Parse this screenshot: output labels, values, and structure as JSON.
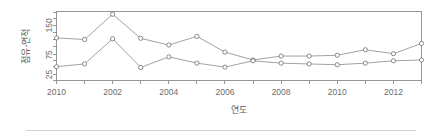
{
  "figure": {
    "width": 442,
    "height": 136,
    "background": "#ffffff",
    "line_color": "#8a8a8a",
    "marker_stroke": "#6e6e6e",
    "axis_color": "#7d7d7d",
    "text_color": "#6b6b6b"
  },
  "footer": {
    "rule_color": "#d2d2d2"
  },
  "chart_data": {
    "type": "line",
    "title": "",
    "xlabel": "연도",
    "ylabel": "점유-면적",
    "grid": false,
    "legend": false,
    "marker": "open-circle",
    "xlim": [
      0,
      13
    ],
    "ylim": [
      10,
      185
    ],
    "x": [
      0,
      1,
      2,
      3,
      4,
      5,
      6,
      7,
      8,
      9,
      10,
      11,
      12,
      13
    ],
    "x_tick_positions": [
      0,
      1,
      2,
      3,
      4,
      5,
      6,
      7,
      8,
      9,
      10,
      11,
      12,
      13
    ],
    "x_tick_labels": [
      "2010",
      "",
      "2002",
      "",
      "2004",
      "",
      "2006",
      "",
      "2008",
      "",
      "2010",
      "",
      "2012",
      ""
    ],
    "y_tick_values": [
      25,
      75,
      150
    ],
    "y_tick_labels": [
      "25",
      "75",
      "150"
    ],
    "y_minor_ticks": [
      10,
      25,
      45,
      60,
      75,
      95,
      115,
      132,
      150,
      168,
      182
    ],
    "series": [
      {
        "name": "upper",
        "values": [
          118,
          114,
          178,
          117,
          100,
          122,
          82,
          62,
          72,
          72,
          74,
          88,
          78,
          104
        ]
      },
      {
        "name": "lower",
        "values": [
          45,
          52,
          116,
          43,
          70,
          54,
          44,
          60,
          54,
          52,
          50,
          54,
          60,
          62
        ]
      }
    ]
  }
}
